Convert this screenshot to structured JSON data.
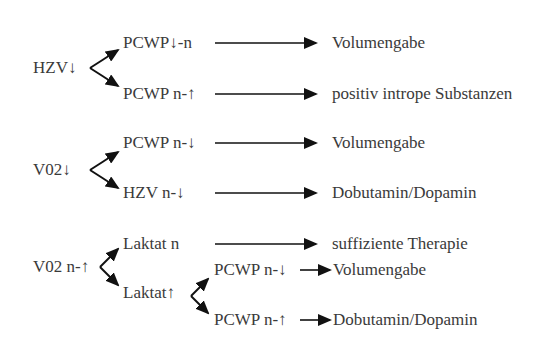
{
  "diagram": {
    "type": "decision-tree",
    "colors": {
      "text": "#3a3a3a",
      "arrow": "#111111",
      "background": "#ffffff"
    },
    "groups": [
      {
        "root": "HZV↓",
        "branches": [
          {
            "condition": "PCWP↓-n",
            "action": "Volumengabe"
          },
          {
            "condition": "PCWP n-↑",
            "action": "positiv intrope Substanzen"
          }
        ]
      },
      {
        "root": "V02↓",
        "branches": [
          {
            "condition": "PCWP n-↓",
            "action": "Volumengabe"
          },
          {
            "condition": "HZV n-↓",
            "action": "Dobutamin/Dopamin"
          }
        ]
      },
      {
        "root": "V02 n-↑",
        "branches": [
          {
            "condition": "Laktat n",
            "action": "suffiziente Therapie"
          },
          {
            "condition": "Laktat↑",
            "sub_branches": [
              {
                "condition": "PCWP n-↓",
                "action": "Volumengabe"
              },
              {
                "condition": "PCWP n-↑",
                "action": "Dobutamin/Dopamin"
              }
            ]
          }
        ]
      }
    ]
  }
}
